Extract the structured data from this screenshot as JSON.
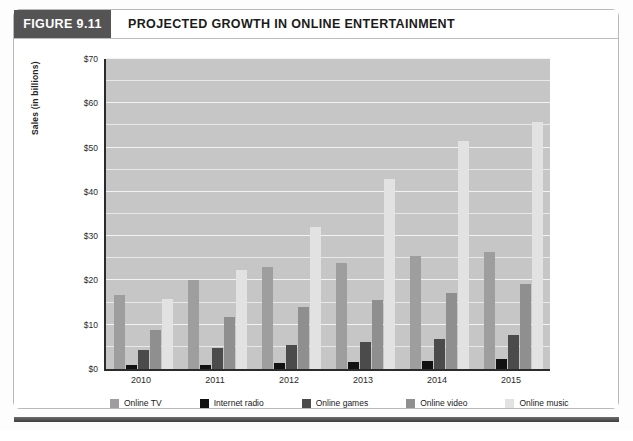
{
  "figure": {
    "tag": "FIGURE 9.11",
    "title": "PROJECTED GROWTH IN ONLINE ENTERTAINMENT"
  },
  "colors": {
    "tag_background": "#545454",
    "plot_background": "#c6c6c6",
    "axis": "#2b2b2b",
    "gridline": "#e8e8e8",
    "series_online_tv": "#9e9e9e",
    "series_internet_radio": "#121212",
    "series_online_games": "#4b4b4b",
    "series_online_video": "#8f8f8f",
    "series_online_music": "#e2e2e2"
  },
  "chart_data": {
    "type": "bar",
    "title": "PROJECTED GROWTH IN ONLINE ENTERTAINMENT",
    "xlabel": "",
    "ylabel": "Sales (in billions)",
    "categories": [
      "2010",
      "2011",
      "2012",
      "2013",
      "2014",
      "2015"
    ],
    "ylim": [
      0,
      70
    ],
    "yticks": [
      0,
      10,
      20,
      30,
      40,
      50,
      60,
      70
    ],
    "ytick_labels": [
      "$0",
      "$10",
      "$20",
      "$30",
      "$40",
      "$50",
      "$60",
      "$70"
    ],
    "grid": true,
    "grid_interval": 5,
    "legend_position": "bottom",
    "series": [
      {
        "name": "Online TV",
        "color": "#9e9e9e",
        "values": [
          16.8,
          20.1,
          23.0,
          24.0,
          25.5,
          26.5
        ]
      },
      {
        "name": "Internet radio",
        "color": "#121212",
        "values": [
          0.8,
          1.0,
          1.3,
          1.6,
          1.9,
          2.2
        ]
      },
      {
        "name": "Online games",
        "color": "#4b4b4b",
        "values": [
          4.2,
          4.8,
          5.4,
          6.1,
          6.8,
          7.6
        ]
      },
      {
        "name": "Online video",
        "color": "#8f8f8f",
        "values": [
          8.9,
          11.7,
          14.0,
          15.6,
          17.2,
          19.3
        ]
      },
      {
        "name": "Online music",
        "color": "#e2e2e2",
        "values": [
          15.7,
          22.3,
          32.0,
          42.8,
          51.5,
          55.8
        ]
      },
      {
        "name": "Online video (total)",
        "color": "#8f8f8f",
        "values": [
          null,
          null,
          null,
          null,
          null,
          null
        ]
      }
    ],
    "grouped_bars": [
      {
        "category": "2010",
        "bars": [
          {
            "series": "Online TV",
            "value": 16.8
          },
          {
            "series": "Internet radio",
            "value": 0.8
          },
          {
            "series": "Online games",
            "value": 4.2
          },
          {
            "series": "Online video",
            "value": 8.9
          },
          {
            "series": "Online TV",
            "value": 16.0
          },
          {
            "series": "Online music",
            "value": 34.5
          },
          {
            "series": "Online video",
            "value": 15.7
          }
        ]
      }
    ]
  },
  "axis": {
    "y_title": "Sales (in billions)"
  },
  "legend": {
    "items": [
      {
        "label": "Online TV"
      },
      {
        "label": "Internet radio"
      },
      {
        "label": "Online games"
      },
      {
        "label": "Online video"
      },
      {
        "label": "Online music"
      }
    ]
  }
}
